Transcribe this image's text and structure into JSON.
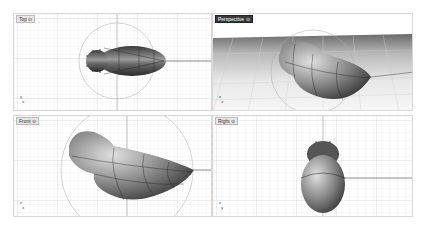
{
  "app": "Rhino 3D modeling viewports",
  "viewports": [
    {
      "id": "top",
      "label": "Top ⊙",
      "active": false
    },
    {
      "id": "perspective",
      "label": "Perspective ⊙",
      "active": true
    },
    {
      "id": "front",
      "label": "Front ⊙",
      "active": false
    },
    {
      "id": "right",
      "label": "Right ⊙",
      "active": false
    }
  ],
  "axes": {
    "x": "x",
    "y": "y",
    "z": "z"
  },
  "colors": {
    "background": "#ffffff",
    "grid_minor": "#e4e4e4",
    "grid_major": "#bdbdbd",
    "axis_line": "#6e6e6e",
    "shape_dark": "#2b2b2b",
    "shape_light": "#cfcfcf",
    "label_active_bg": "#3a3a3a"
  }
}
